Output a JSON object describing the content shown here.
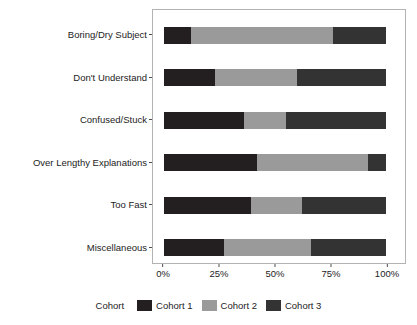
{
  "chart_data": {
    "type": "bar",
    "orientation": "horizontal",
    "stacked": true,
    "normalized": true,
    "title": "",
    "xlabel": "",
    "ylabel": "",
    "xlim": [
      0,
      100
    ],
    "grid": false,
    "categories": [
      "Boring/Dry Subject",
      "Don't Understand",
      "Confused/Stuck",
      "Over Lengthy Explanations",
      "Too Fast",
      "Miscellaneous"
    ],
    "xtick_labels": [
      "0%",
      "25%",
      "50%",
      "75%",
      "100%"
    ],
    "xtick_values": [
      0,
      25,
      50,
      75,
      100
    ],
    "legend_title": "Cohort",
    "legend_position": "bottom",
    "series": [
      {
        "name": "Cohort 1",
        "color": "#231f20",
        "values": [
          12,
          23,
          36,
          42,
          39,
          27
        ]
      },
      {
        "name": "Cohort 2",
        "color": "#9a9a9a",
        "values": [
          64,
          37,
          19,
          50,
          23,
          39
        ]
      },
      {
        "name": "Cohort 3",
        "color": "#333333",
        "values": [
          24,
          40,
          45,
          8,
          38,
          34
        ]
      }
    ]
  },
  "colors": {
    "panel_border": "#b3b3b3",
    "axis_text": "#1c1c1c",
    "tick_mark": "#4d4d4d",
    "background": "#ffffff"
  }
}
